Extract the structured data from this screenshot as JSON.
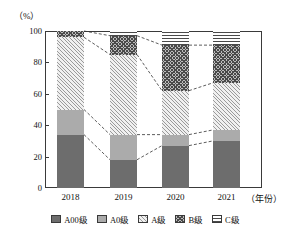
{
  "chart_data": {
    "type": "bar",
    "subtype": "stacked-percentage-column",
    "title": "",
    "xlabel": "（年份）",
    "ylabel": "（%）",
    "ylim": [
      0,
      100
    ],
    "yticks": [
      0,
      20,
      40,
      60,
      80,
      100
    ],
    "grid": false,
    "legend_position": "bottom",
    "categories": [
      "2018",
      "2019",
      "2020",
      "2021"
    ],
    "series": [
      {
        "name": "A00级",
        "values": [
          34,
          18,
          27,
          30
        ]
      },
      {
        "name": "A0级",
        "values": [
          16,
          16,
          7,
          7
        ]
      },
      {
        "name": "A级",
        "values": [
          46,
          51,
          28,
          30
        ]
      },
      {
        "name": "B级",
        "values": [
          4,
          12,
          29,
          24
        ]
      },
      {
        "name": "C级",
        "values": [
          0,
          3,
          9,
          9
        ]
      }
    ],
    "annotations": "Dashed leader lines connect matching stack boundaries between adjacent year columns."
  },
  "axes": {
    "y_unit_label": "（%）",
    "y_tick_labels": [
      "100",
      "80",
      "60",
      "40",
      "20",
      "0"
    ],
    "x_tick_labels": [
      "2018",
      "2019",
      "2020",
      "2021"
    ],
    "x_axis_title": "（年份）"
  },
  "legend": {
    "items": [
      {
        "label": "A00级",
        "pattern": "solid-dark-gray",
        "color": "#6d6d6d"
      },
      {
        "label": "A0级",
        "pattern": "solid-medium-gray",
        "color": "#ababab"
      },
      {
        "label": "A级",
        "pattern": "diagonal-hatch-light",
        "color": "#9a9a9a"
      },
      {
        "label": "B级",
        "pattern": "cross-hatch-dark",
        "color": "#4a4a4a"
      },
      {
        "label": "C级",
        "pattern": "horizontal-lines",
        "color": "#4a4a4a"
      }
    ]
  }
}
